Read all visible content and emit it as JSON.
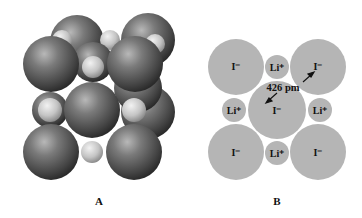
{
  "panels": [
    {
      "id": "A",
      "label": "A",
      "description": "space-filling model of LiI crystal lattice"
    },
    {
      "id": "B",
      "label": "B",
      "description": "cross-section of LiI lattice face"
    }
  ],
  "panel_b": {
    "large_ion": "I⁻",
    "small_ion": "Li⁺",
    "distance_label": "426 pm"
  },
  "colors": {
    "panel_b_fill": "#b5b5b5",
    "large_sphere": "#5a5a5a",
    "small_sphere": "#c8c8c8",
    "text": "#111111"
  }
}
